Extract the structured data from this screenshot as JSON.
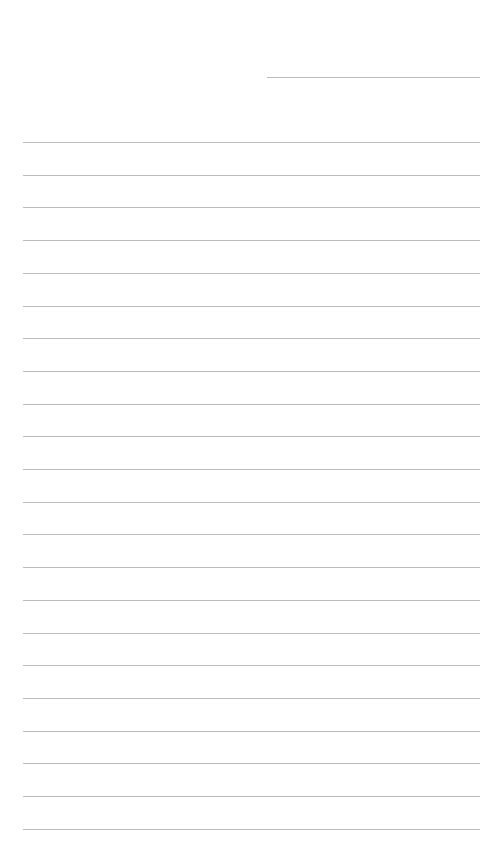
{
  "page": {
    "type": "lined-paper",
    "background_color": "#ffffff",
    "line_color": "#bcbcbc"
  },
  "header_line": {
    "label": "",
    "left": 267,
    "width": 213,
    "top": 77
  },
  "ruled_lines": {
    "count": 22,
    "first_top": 142,
    "spacing": 32.7,
    "left": 23,
    "width": 457,
    "content": [
      "",
      "",
      "",
      "",
      "",
      "",
      "",
      "",
      "",
      "",
      "",
      "",
      "",
      "",
      "",
      "",
      "",
      "",
      "",
      "",
      "",
      ""
    ]
  }
}
